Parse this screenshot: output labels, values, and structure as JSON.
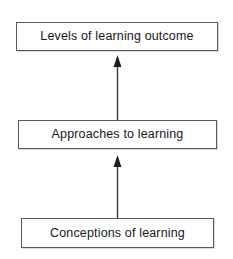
{
  "diagram": {
    "background_color": "#ffffff",
    "box_border_color": "#5a5a5a",
    "text_color": "#16181a",
    "arrow_color": "#1d1d1d",
    "nodes": [
      {
        "id": "levels",
        "label": "Levels of learning outcome",
        "order": 3
      },
      {
        "id": "approaches",
        "label": "Approaches to learning",
        "order": 2
      },
      {
        "id": "conceptions",
        "label": "Conceptions of learning",
        "order": 1
      }
    ],
    "connectors": [
      {
        "id": "approaches-to-levels",
        "icon": "arrow-up-icon",
        "from": "approaches",
        "to": "levels",
        "direction": "up"
      },
      {
        "id": "conceptions-to-approaches",
        "icon": "arrow-up-icon",
        "from": "conceptions",
        "to": "approaches",
        "direction": "up"
      }
    ]
  }
}
